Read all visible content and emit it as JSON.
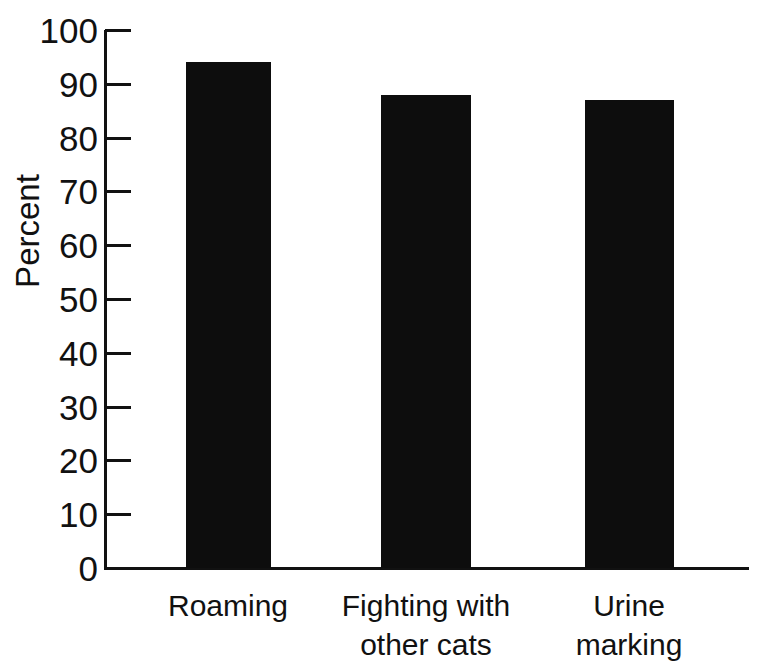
{
  "chart_data": {
    "type": "bar",
    "title": "",
    "xlabel": "",
    "ylabel": "Percent",
    "categories": [
      "Roaming",
      "Fighting with other cats",
      "Urine marking"
    ],
    "category_lines": [
      [
        "Roaming"
      ],
      [
        "Fighting with",
        "other cats"
      ],
      [
        "Urine",
        "marking"
      ]
    ],
    "values": [
      94,
      88,
      87
    ],
    "ylim": [
      0,
      100
    ],
    "ytick_step": 10,
    "yticks": [
      100,
      90,
      80,
      70,
      60,
      50,
      40,
      30,
      20,
      10,
      0
    ],
    "ytick_labels": [
      "100",
      "90",
      "80",
      "70",
      "60",
      "50",
      "40",
      "30",
      "20",
      "10",
      "0"
    ],
    "grid": false,
    "legend": null,
    "bar_color": "#0d0d0d",
    "axis_color": "#111111",
    "background_color": "#ffffff"
  }
}
